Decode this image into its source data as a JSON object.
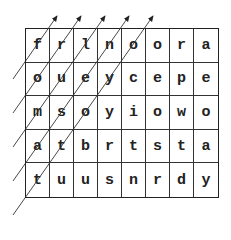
{
  "puzzle": {
    "type": "letter-grid",
    "rows": [
      [
        "f",
        "r",
        "l",
        "n",
        "o",
        "o",
        "r",
        "a"
      ],
      [
        "o",
        "u",
        "e",
        "y",
        "c",
        "e",
        "p",
        "e"
      ],
      [
        "m",
        "s",
        "o",
        "y",
        "i",
        "o",
        "w",
        "o"
      ],
      [
        "a",
        "t",
        "b",
        "r",
        "t",
        "s",
        "t",
        "a"
      ],
      [
        "t",
        "u",
        "u",
        "s",
        "n",
        "r",
        "d",
        "y"
      ]
    ],
    "diagonal_arrows": [
      {
        "from": [
          13,
          79
        ],
        "to": [
          57,
          16
        ]
      },
      {
        "from": [
          13,
          113
        ],
        "to": [
          81,
          16
        ]
      },
      {
        "from": [
          13,
          147
        ],
        "to": [
          105,
          16
        ]
      },
      {
        "from": [
          13,
          181
        ],
        "to": [
          129,
          16
        ]
      },
      {
        "from": [
          13,
          215
        ],
        "to": [
          153,
          16
        ]
      }
    ],
    "arrow_direction": "up-right",
    "line_color": "#333333"
  }
}
